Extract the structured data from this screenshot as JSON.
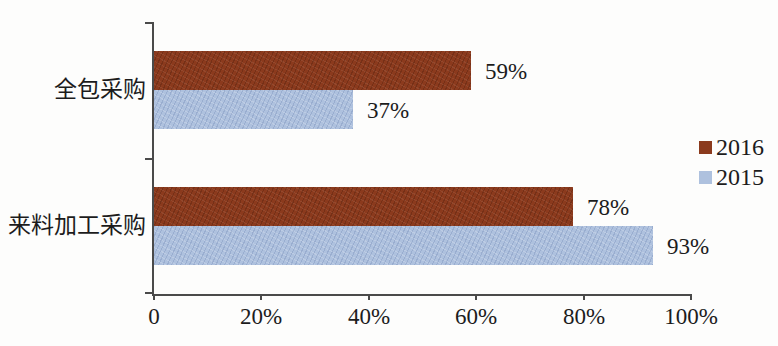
{
  "chart_data": {
    "type": "bar",
    "orientation": "horizontal",
    "title": "",
    "categories": [
      "全包采购",
      "来料加工采购"
    ],
    "series": [
      {
        "name": "2016",
        "color": "#8B3A1D",
        "values": [
          59,
          78
        ],
        "data_labels": [
          "59%",
          "78%"
        ]
      },
      {
        "name": "2015",
        "color": "#AEC1DE",
        "values": [
          37,
          93
        ],
        "data_labels": [
          "37%",
          "93%"
        ]
      }
    ],
    "xlim": [
      0,
      100
    ],
    "x_ticks": [
      {
        "value": 0,
        "label": "0"
      },
      {
        "value": 20,
        "label": "20%"
      },
      {
        "value": 40,
        "label": "40%"
      },
      {
        "value": 60,
        "label": "60%"
      },
      {
        "value": 80,
        "label": "80%"
      },
      {
        "value": 100,
        "label": "100%"
      }
    ],
    "grid": false,
    "legend_position": "right",
    "legend": [
      "2016",
      "2015"
    ]
  },
  "colors": {
    "axis": "#4a4a4a",
    "text": "#1c1c1c",
    "background": "#fdfdfc",
    "series_2016": "#8B3A1D",
    "series_2015": "#AEC1DE"
  }
}
